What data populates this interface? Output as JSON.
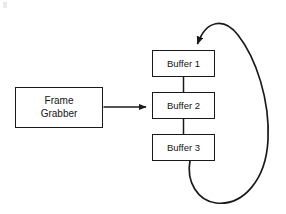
{
  "diagram": {
    "background_color": "#ffffff",
    "stroke_color": "#1a1a1a",
    "nodes": [
      {
        "id": "frame-grabber",
        "label": "Frame\nGrabber",
        "shape": "rectangle",
        "x": 15,
        "y": 87,
        "width": 88,
        "height": 41
      },
      {
        "id": "buffer-1",
        "label": "Buffer 1",
        "shape": "rectangle",
        "x": 152,
        "y": 50,
        "width": 63,
        "height": 27
      },
      {
        "id": "buffer-2",
        "label": "Buffer 2",
        "shape": "rectangle",
        "x": 152,
        "y": 92,
        "width": 63,
        "height": 27
      },
      {
        "id": "buffer-3",
        "label": "Buffer 3",
        "shape": "rectangle",
        "x": 152,
        "y": 134,
        "width": 63,
        "height": 27
      }
    ],
    "connectors": [
      {
        "id": "grabber-to-buffers",
        "from": "frame-grabber",
        "to": "buffer-2",
        "style": "straight-arrow",
        "arrowhead": true
      },
      {
        "id": "buffer-1-to-buffer-2",
        "from": "buffer-1",
        "to": "buffer-2",
        "style": "straight-line",
        "arrowhead": false
      },
      {
        "id": "buffer-2-to-buffer-3",
        "from": "buffer-2",
        "to": "buffer-3",
        "style": "straight-line",
        "arrowhead": false
      },
      {
        "id": "buffer-3-to-buffer-1-loop",
        "from": "buffer-3",
        "to": "buffer-1",
        "style": "curved-ring-arrow",
        "arrowhead": true
      }
    ]
  }
}
